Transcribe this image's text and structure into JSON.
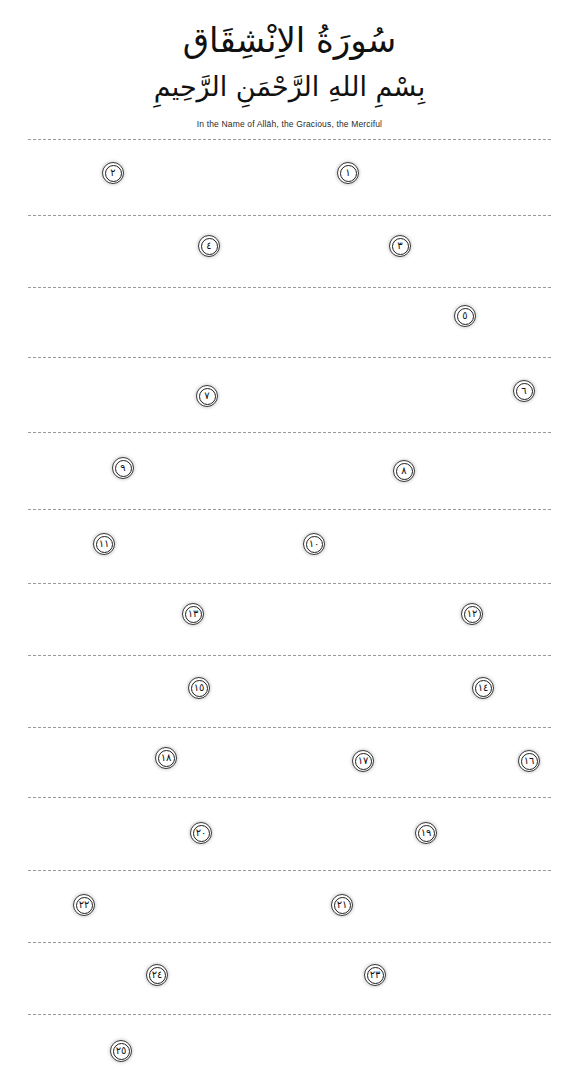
{
  "page": {
    "width": 579,
    "height": 1088,
    "background": "#ffffff",
    "ink_color": "#111111",
    "rule_color": "#9a9a9a"
  },
  "header": {
    "surah_title_arabic": "سُورَةُ الاِنْشِقَاق",
    "basmala_arabic": "بِسْمِ اللهِ الرَّحْمَنِ الرَّحِيمِ",
    "basmala_translation": "In the Name of Allāh, the Gracious, the Merciful"
  },
  "rule_lines": [
    {
      "y": 139
    },
    {
      "y": 215
    },
    {
      "y": 287
    },
    {
      "y": 357
    },
    {
      "y": 432
    },
    {
      "y": 509
    },
    {
      "y": 583
    },
    {
      "y": 655
    },
    {
      "y": 727
    },
    {
      "y": 797
    },
    {
      "y": 870
    },
    {
      "y": 942
    },
    {
      "y": 1014
    }
  ],
  "verse_markers": [
    {
      "number": "١",
      "arabic": "١",
      "latin": 1,
      "x": 337,
      "y": 162
    },
    {
      "number": "٢",
      "arabic": "٢",
      "latin": 2,
      "x": 102,
      "y": 162
    },
    {
      "number": "٣",
      "arabic": "٣",
      "latin": 3,
      "x": 389,
      "y": 235
    },
    {
      "number": "٤",
      "arabic": "٤",
      "latin": 4,
      "x": 198,
      "y": 235
    },
    {
      "number": "٥",
      "arabic": "٥",
      "latin": 5,
      "x": 454,
      "y": 305
    },
    {
      "number": "٦",
      "arabic": "٦",
      "latin": 6,
      "x": 513,
      "y": 380
    },
    {
      "number": "٧",
      "arabic": "٧",
      "latin": 7,
      "x": 196,
      "y": 385
    },
    {
      "number": "٨",
      "arabic": "٨",
      "latin": 8,
      "x": 393,
      "y": 460
    },
    {
      "number": "٩",
      "arabic": "٩",
      "latin": 9,
      "x": 112,
      "y": 457
    },
    {
      "number": "١٠",
      "arabic": "١٠",
      "latin": 10,
      "x": 303,
      "y": 533
    },
    {
      "number": "١١",
      "arabic": "١١",
      "latin": 11,
      "x": 93,
      "y": 533
    },
    {
      "number": "١٢",
      "arabic": "١٢",
      "latin": 12,
      "x": 461,
      "y": 603
    },
    {
      "number": "١٣",
      "arabic": "١٣",
      "latin": 13,
      "x": 182,
      "y": 603
    },
    {
      "number": "١٤",
      "arabic": "١٤",
      "latin": 14,
      "x": 472,
      "y": 677
    },
    {
      "number": "١٥",
      "arabic": "١٥",
      "latin": 15,
      "x": 188,
      "y": 677
    },
    {
      "number": "١٦",
      "arabic": "١٦",
      "latin": 16,
      "x": 518,
      "y": 750
    },
    {
      "number": "١٧",
      "arabic": "١٧",
      "latin": 17,
      "x": 352,
      "y": 750
    },
    {
      "number": "١٨",
      "arabic": "١٨",
      "latin": 18,
      "x": 155,
      "y": 747
    },
    {
      "number": "١٩",
      "arabic": "١٩",
      "latin": 19,
      "x": 415,
      "y": 822
    },
    {
      "number": "٢٠",
      "arabic": "٢٠",
      "latin": 20,
      "x": 190,
      "y": 822
    },
    {
      "number": "٢١",
      "arabic": "٢١",
      "latin": 21,
      "x": 331,
      "y": 894
    },
    {
      "number": "٢٢",
      "arabic": "٢٢",
      "latin": 22,
      "x": 73,
      "y": 894
    },
    {
      "number": "٢٣",
      "arabic": "٢٣",
      "latin": 23,
      "x": 364,
      "y": 964
    },
    {
      "number": "٢٤",
      "arabic": "٢٤",
      "latin": 24,
      "x": 146,
      "y": 964
    },
    {
      "number": "٢٥",
      "arabic": "٢٥",
      "latin": 25,
      "x": 110,
      "y": 1040
    }
  ]
}
